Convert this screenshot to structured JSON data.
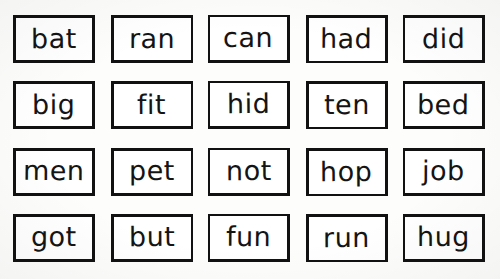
{
  "worksheet": {
    "kind": "word-card-grid",
    "background_color": "#fdfdfc",
    "border_color": "#111111",
    "text_color": "#141414",
    "columns": 5,
    "rows": 4,
    "cards": [
      {
        "word": "bat"
      },
      {
        "word": "ran"
      },
      {
        "word": "can"
      },
      {
        "word": "had"
      },
      {
        "word": "did"
      },
      {
        "word": "big"
      },
      {
        "word": "fit"
      },
      {
        "word": "hid"
      },
      {
        "word": "ten"
      },
      {
        "word": "bed"
      },
      {
        "word": "men"
      },
      {
        "word": "pet"
      },
      {
        "word": "not"
      },
      {
        "word": "hop"
      },
      {
        "word": "job"
      },
      {
        "word": "got"
      },
      {
        "word": "but"
      },
      {
        "word": "fun"
      },
      {
        "word": "run"
      },
      {
        "word": "hug"
      }
    ]
  }
}
